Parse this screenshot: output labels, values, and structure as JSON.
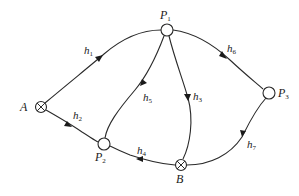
{
  "diagram": {
    "nodes": [
      {
        "id": "P1",
        "type": "circle",
        "label": "P",
        "sub": "1"
      },
      {
        "id": "P2",
        "type": "circle",
        "label": "P",
        "sub": "2"
      },
      {
        "id": "P3",
        "type": "circle",
        "label": "P",
        "sub": "3"
      },
      {
        "id": "A",
        "type": "crossed-circle",
        "label": "A"
      },
      {
        "id": "B",
        "type": "crossed-circle",
        "label": "B"
      }
    ],
    "edges": [
      {
        "id": "h1",
        "from": "A",
        "to": "P1",
        "label": "h",
        "sub": "1"
      },
      {
        "id": "h2",
        "from": "A",
        "to": "P2",
        "label": "h",
        "sub": "2"
      },
      {
        "id": "h3",
        "from": "P1",
        "to": "B",
        "label": "h",
        "sub": "3"
      },
      {
        "id": "h4",
        "from": "B",
        "to": "P2",
        "label": "h",
        "sub": "4"
      },
      {
        "id": "h5",
        "from": "P1",
        "to": "P2",
        "label": "h",
        "sub": "5"
      },
      {
        "id": "h6",
        "from": "P1",
        "to": "P3",
        "label": "h",
        "sub": "6"
      },
      {
        "id": "h7",
        "from": "P3",
        "to": "B",
        "label": "h",
        "sub": "7"
      }
    ],
    "colors": {
      "stroke": "#2a2a2a",
      "background": "#ffffff"
    }
  }
}
